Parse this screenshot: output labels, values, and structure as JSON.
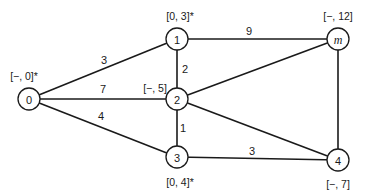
{
  "diagram": {
    "type": "weighted-graph",
    "nodes": [
      {
        "id": "0",
        "label": "0",
        "x": 29,
        "y": 99,
        "italic": false,
        "tag": "[−, 0]*",
        "tag_x": 24,
        "tag_y": 76
      },
      {
        "id": "1",
        "label": "1",
        "x": 177,
        "y": 39,
        "italic": false,
        "tag": "[0, 3]*",
        "tag_x": 180,
        "tag_y": 16
      },
      {
        "id": "2",
        "label": "2",
        "x": 177,
        "y": 99,
        "italic": false,
        "tag": "[−, 5]",
        "tag_x": 155,
        "tag_y": 88
      },
      {
        "id": "3",
        "label": "3",
        "x": 177,
        "y": 157,
        "italic": false,
        "tag": "[0, 4]*",
        "tag_x": 180,
        "tag_y": 182
      },
      {
        "id": "m",
        "label": "m",
        "x": 338,
        "y": 39,
        "italic": true,
        "tag": "[−, 12]",
        "tag_x": 338,
        "tag_y": 16
      },
      {
        "id": "4",
        "label": "4",
        "x": 338,
        "y": 160,
        "italic": false,
        "tag": "[−, 7]",
        "tag_x": 338,
        "tag_y": 184
      }
    ],
    "edges": [
      {
        "from": "0",
        "to": "1",
        "weight": "3",
        "wx": 104,
        "wy": 60
      },
      {
        "from": "0",
        "to": "2",
        "weight": "7",
        "wx": 103,
        "wy": 89
      },
      {
        "from": "0",
        "to": "3",
        "weight": "4",
        "wx": 101,
        "wy": 116
      },
      {
        "from": "1",
        "to": "2",
        "weight": "2",
        "wx": 185,
        "wy": 69
      },
      {
        "from": "1",
        "to": "m",
        "weight": "9",
        "wx": 249,
        "wy": 31
      },
      {
        "from": "2",
        "to": "3",
        "weight": "1",
        "wx": 183,
        "wy": 128
      },
      {
        "from": "2",
        "to": "m",
        "weight": "",
        "wx": 0,
        "wy": 0
      },
      {
        "from": "2",
        "to": "4",
        "weight": "",
        "wx": 0,
        "wy": 0
      },
      {
        "from": "3",
        "to": "4",
        "weight": "3",
        "wx": 252,
        "wy": 151
      },
      {
        "from": "m",
        "to": "4",
        "weight": "",
        "wx": 0,
        "wy": 0
      }
    ],
    "node_radius": 11
  }
}
